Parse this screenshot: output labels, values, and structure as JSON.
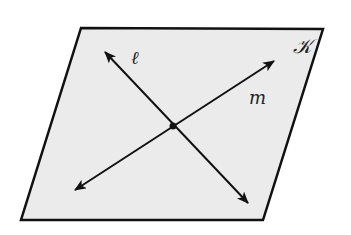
{
  "diagram": {
    "type": "geometry-plane-intersecting-lines",
    "plane": {
      "label": "𝒦",
      "fill": "#ebebeb",
      "stroke": "#111111",
      "corners": [
        [
          81,
          28
        ],
        [
          323,
          29
        ],
        [
          263,
          220
        ],
        [
          21,
          220
        ]
      ]
    },
    "lines": [
      {
        "label": "ℓ",
        "from": [
          105,
          52
        ],
        "to": [
          248,
          203
        ],
        "label_pos": [
          134,
          63
        ]
      },
      {
        "label": "m",
        "from": [
          75,
          190
        ],
        "to": [
          274,
          61
        ],
        "label_pos": [
          250,
          104
        ]
      }
    ],
    "intersection_point": [
      173,
      126
    ],
    "colors": {
      "line": "#111111",
      "background": "#ffffff"
    }
  }
}
